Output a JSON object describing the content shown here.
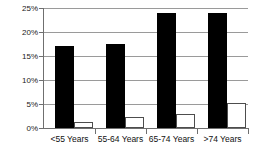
{
  "chart_data": {
    "type": "bar",
    "title": "",
    "subtitle": "",
    "xlabel": "",
    "ylabel": "",
    "categories": [
      "<55 Years",
      "55-64 Years",
      "65-74 Years",
      ">74 Years"
    ],
    "series": [
      {
        "name": "series-dark",
        "color": "#000000",
        "values": [
          17.0,
          17.6,
          24.0,
          24.0
        ]
      },
      {
        "name": "series-light",
        "color": "#ffffff",
        "values": [
          1.2,
          2.3,
          2.9,
          5.2
        ]
      }
    ],
    "ylim": [
      0,
      25
    ],
    "ytick_values": [
      0,
      5,
      10,
      15,
      20,
      25
    ],
    "ytick_labels": [
      "0%",
      "5%",
      "10%",
      "15%",
      "20%",
      "25%"
    ],
    "grid": true,
    "grid_axis": "y",
    "legend": null,
    "legend_position": "none",
    "annotations": []
  },
  "style": {
    "grid_color": "#9a9a9a",
    "axis_color": "#6f6f6f",
    "background": "#ffffff",
    "text_color": "#111111"
  }
}
